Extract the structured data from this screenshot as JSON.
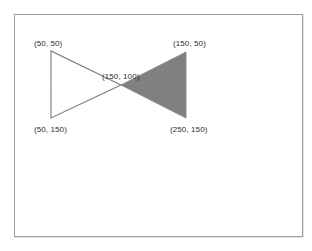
{
  "figure": {
    "background_color": "#ffffff",
    "frame_border_color": "#9c9c9c",
    "outline_color": "#7a7a7a",
    "fill_color": "#808080",
    "shapes": [
      {
        "name": "unfilled-triangle",
        "style": "outline",
        "stroke": "#7a7a7a",
        "fill": "none",
        "points_model": [
          [
            50,
            50
          ],
          [
            50,
            150
          ],
          [
            150,
            100
          ]
        ],
        "points_px": "36,36 36,103 106,70"
      },
      {
        "name": "filled-triangle",
        "style": "filled",
        "stroke": "#808080",
        "fill": "#808080",
        "points_model": [
          [
            150,
            100
          ],
          [
            150,
            50
          ],
          [
            250,
            150
          ]
        ],
        "points_px": "106,70 171,37 171,103"
      }
    ],
    "labels": {
      "top_left": "(50, 50)",
      "top_right": "(150, 50)",
      "apex": "(150, 100)",
      "bottom_left": "(50, 150)",
      "bottom_right": "(250, 150)"
    }
  },
  "chart_data": {
    "type": "scatter",
    "title": "",
    "xlabel": "",
    "ylabel": "",
    "xlim": [
      0,
      300
    ],
    "ylim": [
      200,
      0
    ],
    "grid": false,
    "legend": null,
    "annotations": [
      {
        "text": "(50, 50)",
        "x": 50,
        "y": 50
      },
      {
        "text": "(150, 50)",
        "x": 150,
        "y": 50
      },
      {
        "text": "(150, 100)",
        "x": 150,
        "y": 100
      },
      {
        "text": "(50, 150)",
        "x": 50,
        "y": 150
      },
      {
        "text": "(250, 150)",
        "x": 250,
        "y": 150
      }
    ],
    "series": [
      {
        "name": "unfilled-triangle",
        "type": "polygon",
        "filled": false,
        "color": "#7a7a7a",
        "x": [
          50,
          50,
          150
        ],
        "y": [
          50,
          150,
          100
        ]
      },
      {
        "name": "filled-triangle",
        "type": "polygon",
        "filled": true,
        "color": "#808080",
        "x": [
          150,
          150,
          250
        ],
        "y": [
          100,
          50,
          150
        ]
      }
    ]
  }
}
